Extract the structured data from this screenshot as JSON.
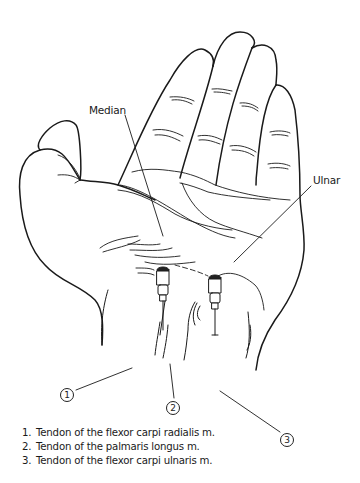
{
  "figure": {
    "labels": {
      "median": "Median",
      "ulnar": "Ulnar"
    },
    "markers": [
      {
        "number": "1"
      },
      {
        "number": "2"
      },
      {
        "number": "3"
      }
    ],
    "legend": [
      {
        "number": "1.",
        "text": "Tendon of the flexor carpi radialis m."
      },
      {
        "number": "2.",
        "text": "Tendon of the palmaris longus m."
      },
      {
        "number": "3.",
        "text": "Tendon of the flexor carpi ulnaris m."
      }
    ],
    "colors": {
      "line": "#1a1a1a",
      "background": "#ffffff"
    }
  }
}
